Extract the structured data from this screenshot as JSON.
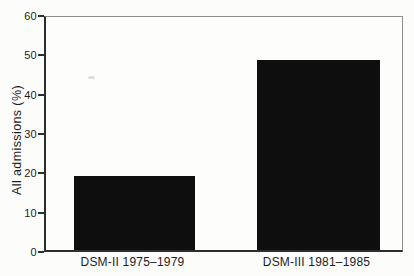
{
  "figure": {
    "background": "#fcfcfb",
    "axis_color": "#2e2e2e",
    "frame_color": "#8c8c8c",
    "bar_color": "#0e0e0e",
    "text_color": "#1c1c1c"
  },
  "chart_data": {
    "type": "bar",
    "title": "",
    "subtitle": "",
    "categories": [
      "DSM-II 1975–1979",
      "DSM-III 1981–1985"
    ],
    "values": [
      19,
      49
    ],
    "xlabel": "",
    "ylabel": "All admissions (%)",
    "ylim": [
      0,
      60
    ],
    "yticks": [
      0,
      10,
      20,
      30,
      40,
      50,
      60
    ],
    "grid": false,
    "legend": "none",
    "bar_color": "#0e0e0e",
    "frame": "full-box",
    "tick_direction": "out"
  }
}
